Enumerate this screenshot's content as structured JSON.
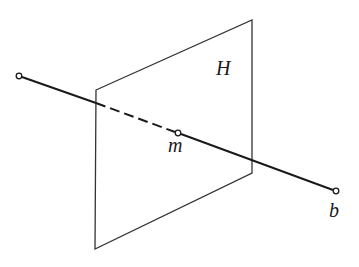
{
  "figure": {
    "type": "line-plane-intersection",
    "plane": {
      "label": "H",
      "corners": [
        [
          96,
          90
        ],
        [
          252,
          20
        ],
        [
          252,
          173
        ],
        [
          95,
          249
        ]
      ],
      "label_pos": [
        224,
        75
      ]
    },
    "line": {
      "start": [
        19,
        76
      ],
      "end": [
        336,
        191
      ],
      "entry_point": [
        96,
        103
      ],
      "intersection_point": [
        178,
        133
      ],
      "end_label": "b",
      "end_label_pos": [
        334,
        217
      ]
    },
    "point_m": {
      "label": "m",
      "pos": [
        178,
        133
      ],
      "label_pos": [
        176,
        152
      ]
    },
    "colors": {
      "stroke": "#1a1a1a",
      "plane_stroke": "#333333",
      "background": "#ffffff"
    }
  }
}
